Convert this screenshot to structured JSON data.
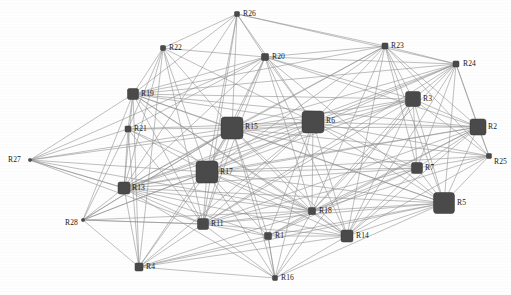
{
  "figure": {
    "type": "network-graph",
    "width": 511,
    "height": 295,
    "background_color": "#ffffff",
    "node_color": "#4a4a4a",
    "edge_color": "#8f8f8f",
    "label_color": "#1a1a1a"
  },
  "chart_data": {
    "type": "scatter",
    "title": "",
    "xlabel": "",
    "ylabel": "",
    "grid": false,
    "legend": "none",
    "layout": "force-directed",
    "node_count": 28,
    "edge_count": 182,
    "nodes": [
      {
        "id": "R1",
        "label": "R1",
        "x": 268,
        "y": 236,
        "size": 7
      },
      {
        "id": "R2",
        "label": "R2",
        "x": 478,
        "y": 127,
        "size": 16
      },
      {
        "id": "R3",
        "label": "R3",
        "x": 413,
        "y": 99,
        "size": 15
      },
      {
        "id": "R4",
        "label": "R4",
        "x": 139,
        "y": 267,
        "size": 8
      },
      {
        "id": "R5",
        "label": "R5",
        "x": 444,
        "y": 203,
        "size": 21
      },
      {
        "id": "R6",
        "label": "R6",
        "x": 313,
        "y": 122,
        "size": 22
      },
      {
        "id": "R7",
        "label": "R7",
        "x": 417,
        "y": 168,
        "size": 11
      },
      {
        "id": "R11",
        "label": "R11",
        "x": 203,
        "y": 224,
        "size": 11
      },
      {
        "id": "R13",
        "label": "R13",
        "x": 124,
        "y": 188,
        "size": 12
      },
      {
        "id": "R14",
        "label": "R14",
        "x": 347,
        "y": 236,
        "size": 12
      },
      {
        "id": "R15",
        "label": "R15",
        "x": 232,
        "y": 128,
        "size": 22
      },
      {
        "id": "R16",
        "label": "R16",
        "x": 275,
        "y": 278,
        "size": 5
      },
      {
        "id": "R17",
        "label": "R17",
        "x": 207,
        "y": 172,
        "size": 22
      },
      {
        "id": "R18",
        "label": "R18",
        "x": 312,
        "y": 211,
        "size": 7
      },
      {
        "id": "R19",
        "label": "R19",
        "x": 133,
        "y": 94,
        "size": 11
      },
      {
        "id": "R20",
        "label": "R20",
        "x": 265,
        "y": 57,
        "size": 7
      },
      {
        "id": "R21",
        "label": "R21",
        "x": 128,
        "y": 129,
        "size": 6
      },
      {
        "id": "R22",
        "label": "R22",
        "x": 163,
        "y": 48,
        "size": 5
      },
      {
        "id": "R23",
        "label": "R23",
        "x": 385,
        "y": 46,
        "size": 6
      },
      {
        "id": "R24",
        "label": "R24",
        "x": 456,
        "y": 64,
        "size": 6
      },
      {
        "id": "R25",
        "label": "R25",
        "x": 489,
        "y": 156,
        "size": 5
      },
      {
        "id": "R26",
        "label": "R26",
        "x": 237,
        "y": 14,
        "size": 5
      },
      {
        "id": "R27",
        "label": "R27",
        "x": 30,
        "y": 160,
        "size": 3
      },
      {
        "id": "R28",
        "label": "R28",
        "x": 83,
        "y": 220,
        "size": 3
      }
    ],
    "label_offsets": {
      "R1": {
        "dx": 7,
        "dy": -4
      },
      "R2": {
        "dx": 10,
        "dy": -4
      },
      "R3": {
        "dx": 10,
        "dy": -4
      },
      "R4": {
        "dx": 7,
        "dy": -4
      },
      "R5": {
        "dx": 13,
        "dy": -4
      },
      "R6": {
        "dx": 13,
        "dy": -5
      },
      "R7": {
        "dx": 8,
        "dy": -4
      },
      "R11": {
        "dx": 8,
        "dy": -4
      },
      "R13": {
        "dx": 8,
        "dy": -4
      },
      "R14": {
        "dx": 9,
        "dy": -4
      },
      "R15": {
        "dx": 13,
        "dy": -5
      },
      "R16": {
        "dx": 6,
        "dy": -4
      },
      "R17": {
        "dx": 13,
        "dy": -4
      },
      "R18": {
        "dx": 7,
        "dy": -4
      },
      "R19": {
        "dx": 8,
        "dy": -4
      },
      "R20": {
        "dx": 7,
        "dy": -4
      },
      "R21": {
        "dx": 6,
        "dy": -4
      },
      "R22": {
        "dx": 6,
        "dy": -4
      },
      "R23": {
        "dx": 6,
        "dy": -4
      },
      "R24": {
        "dx": 7,
        "dy": -4
      },
      "R25": {
        "dx": 5,
        "dy": 2
      },
      "R26": {
        "dx": 6,
        "dy": -4
      },
      "R27": {
        "dx": -22,
        "dy": -4
      },
      "R28": {
        "dx": -18,
        "dy": -1
      }
    },
    "edges": [
      [
        "R26",
        "R22"
      ],
      [
        "R26",
        "R20"
      ],
      [
        "R26",
        "R15"
      ],
      [
        "R26",
        "R17"
      ],
      [
        "R26",
        "R19"
      ],
      [
        "R26",
        "R23"
      ],
      [
        "R26",
        "R24"
      ],
      [
        "R26",
        "R6"
      ],
      [
        "R26",
        "R11"
      ],
      [
        "R26",
        "R13"
      ],
      [
        "R22",
        "R19"
      ],
      [
        "R22",
        "R21"
      ],
      [
        "R22",
        "R15"
      ],
      [
        "R22",
        "R17"
      ],
      [
        "R22",
        "R20"
      ],
      [
        "R22",
        "R6"
      ],
      [
        "R22",
        "R13"
      ],
      [
        "R22",
        "R11"
      ],
      [
        "R22",
        "R4"
      ],
      [
        "R20",
        "R15"
      ],
      [
        "R20",
        "R17"
      ],
      [
        "R20",
        "R6"
      ],
      [
        "R20",
        "R23"
      ],
      [
        "R20",
        "R24"
      ],
      [
        "R20",
        "R3"
      ],
      [
        "R20",
        "R2"
      ],
      [
        "R20",
        "R19"
      ],
      [
        "R20",
        "R21"
      ],
      [
        "R20",
        "R13"
      ],
      [
        "R20",
        "R11"
      ],
      [
        "R20",
        "R18"
      ],
      [
        "R20",
        "R5"
      ],
      [
        "R20",
        "R14"
      ],
      [
        "R20",
        "R27"
      ],
      [
        "R23",
        "R24"
      ],
      [
        "R23",
        "R6"
      ],
      [
        "R23",
        "R3"
      ],
      [
        "R23",
        "R2"
      ],
      [
        "R23",
        "R15"
      ],
      [
        "R23",
        "R17"
      ],
      [
        "R23",
        "R5"
      ],
      [
        "R23",
        "R7"
      ],
      [
        "R23",
        "R18"
      ],
      [
        "R23",
        "R14"
      ],
      [
        "R23",
        "R19"
      ],
      [
        "R23",
        "R13"
      ],
      [
        "R23",
        "R25"
      ],
      [
        "R24",
        "R3"
      ],
      [
        "R24",
        "R2"
      ],
      [
        "R24",
        "R6"
      ],
      [
        "R24",
        "R5"
      ],
      [
        "R24",
        "R7"
      ],
      [
        "R24",
        "R25"
      ],
      [
        "R24",
        "R15"
      ],
      [
        "R24",
        "R17"
      ],
      [
        "R24",
        "R18"
      ],
      [
        "R24",
        "R14"
      ],
      [
        "R24",
        "R13"
      ],
      [
        "R24",
        "R19"
      ],
      [
        "R24",
        "R11"
      ],
      [
        "R19",
        "R21"
      ],
      [
        "R19",
        "R15"
      ],
      [
        "R19",
        "R17"
      ],
      [
        "R19",
        "R13"
      ],
      [
        "R19",
        "R6"
      ],
      [
        "R19",
        "R11"
      ],
      [
        "R19",
        "R4"
      ],
      [
        "R19",
        "R18"
      ],
      [
        "R19",
        "R5"
      ],
      [
        "R19",
        "R14"
      ],
      [
        "R19",
        "R2"
      ],
      [
        "R19",
        "R3"
      ],
      [
        "R19",
        "R28"
      ],
      [
        "R21",
        "R15"
      ],
      [
        "R21",
        "R17"
      ],
      [
        "R21",
        "R13"
      ],
      [
        "R21",
        "R11"
      ],
      [
        "R21",
        "R4"
      ],
      [
        "R21",
        "R6"
      ],
      [
        "R21",
        "R18"
      ],
      [
        "R21",
        "R28"
      ],
      [
        "R15",
        "R17"
      ],
      [
        "R15",
        "R6"
      ],
      [
        "R15",
        "R13"
      ],
      [
        "R15",
        "R11"
      ],
      [
        "R15",
        "R18"
      ],
      [
        "R15",
        "R14"
      ],
      [
        "R15",
        "R5"
      ],
      [
        "R15",
        "R3"
      ],
      [
        "R15",
        "R2"
      ],
      [
        "R15",
        "R7"
      ],
      [
        "R15",
        "R16"
      ],
      [
        "R15",
        "R4"
      ],
      [
        "R15",
        "R1"
      ],
      [
        "R15",
        "R25"
      ],
      [
        "R15",
        "R27"
      ],
      [
        "R15",
        "R28"
      ],
      [
        "R17",
        "R6"
      ],
      [
        "R17",
        "R13"
      ],
      [
        "R17",
        "R11"
      ],
      [
        "R17",
        "R18"
      ],
      [
        "R17",
        "R14"
      ],
      [
        "R17",
        "R5"
      ],
      [
        "R17",
        "R3"
      ],
      [
        "R17",
        "R2"
      ],
      [
        "R17",
        "R7"
      ],
      [
        "R17",
        "R16"
      ],
      [
        "R17",
        "R4"
      ],
      [
        "R17",
        "R1"
      ],
      [
        "R17",
        "R25"
      ],
      [
        "R17",
        "R27"
      ],
      [
        "R17",
        "R28"
      ],
      [
        "R6",
        "R3"
      ],
      [
        "R6",
        "R2"
      ],
      [
        "R6",
        "R5"
      ],
      [
        "R6",
        "R7"
      ],
      [
        "R6",
        "R18"
      ],
      [
        "R6",
        "R14"
      ],
      [
        "R6",
        "R13"
      ],
      [
        "R6",
        "R11"
      ],
      [
        "R6",
        "R16"
      ],
      [
        "R6",
        "R1"
      ],
      [
        "R6",
        "R25"
      ],
      [
        "R6",
        "R4"
      ],
      [
        "R6",
        "R27"
      ],
      [
        "R3",
        "R2"
      ],
      [
        "R3",
        "R5"
      ],
      [
        "R3",
        "R7"
      ],
      [
        "R3",
        "R18"
      ],
      [
        "R3",
        "R14"
      ],
      [
        "R3",
        "R25"
      ],
      [
        "R3",
        "R16"
      ],
      [
        "R3",
        "R11"
      ],
      [
        "R3",
        "R13"
      ],
      [
        "R2",
        "R5"
      ],
      [
        "R2",
        "R7"
      ],
      [
        "R2",
        "R25"
      ],
      [
        "R2",
        "R18"
      ],
      [
        "R2",
        "R14"
      ],
      [
        "R2",
        "R13"
      ],
      [
        "R2",
        "R11"
      ],
      [
        "R2",
        "R1"
      ],
      [
        "R5",
        "R7"
      ],
      [
        "R5",
        "R18"
      ],
      [
        "R5",
        "R14"
      ],
      [
        "R5",
        "R25"
      ],
      [
        "R5",
        "R16"
      ],
      [
        "R5",
        "R11"
      ],
      [
        "R5",
        "R13"
      ],
      [
        "R5",
        "R1"
      ],
      [
        "R5",
        "R4"
      ],
      [
        "R7",
        "R18"
      ],
      [
        "R7",
        "R14"
      ],
      [
        "R7",
        "R25"
      ],
      [
        "R7",
        "R11"
      ],
      [
        "R7",
        "R13"
      ],
      [
        "R7",
        "R1"
      ],
      [
        "R18",
        "R14"
      ],
      [
        "R18",
        "R11"
      ],
      [
        "R18",
        "R13"
      ],
      [
        "R18",
        "R16"
      ],
      [
        "R18",
        "R1"
      ],
      [
        "R18",
        "R28"
      ],
      [
        "R18",
        "R4"
      ],
      [
        "R14",
        "R11"
      ],
      [
        "R14",
        "R16"
      ],
      [
        "R14",
        "R13"
      ],
      [
        "R14",
        "R1"
      ],
      [
        "R14",
        "R4"
      ],
      [
        "R13",
        "R11"
      ],
      [
        "R13",
        "R4"
      ],
      [
        "R13",
        "R28"
      ],
      [
        "R13",
        "R27"
      ],
      [
        "R13",
        "R16"
      ],
      [
        "R13",
        "R1"
      ],
      [
        "R11",
        "R4"
      ],
      [
        "R11",
        "R16"
      ],
      [
        "R11",
        "R1"
      ],
      [
        "R11",
        "R28"
      ],
      [
        "R4",
        "R16"
      ],
      [
        "R4",
        "R1"
      ],
      [
        "R27",
        "R21"
      ],
      [
        "R27",
        "R19"
      ],
      [
        "R27",
        "R13"
      ],
      [
        "R27",
        "R11"
      ],
      [
        "R27",
        "R18"
      ],
      [
        "R28",
        "R11"
      ],
      [
        "R28",
        "R17"
      ],
      [
        "R28",
        "R15"
      ],
      [
        "R28",
        "R4"
      ],
      [
        "R16",
        "R1"
      ],
      [
        "R25",
        "R14"
      ],
      [
        "R25",
        "R18"
      ],
      [
        "R1",
        "R16"
      ]
    ]
  }
}
